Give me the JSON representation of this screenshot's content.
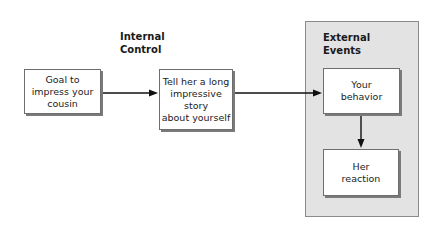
{
  "labels": {
    "internal_control": [
      "Internal",
      "Control"
    ],
    "external_events": [
      "External",
      "Events"
    ]
  },
  "nodes": {
    "goal": [
      "Goal to",
      "impress your",
      "cousin"
    ],
    "story": [
      "Tell her a long",
      "impressive",
      "story",
      "about yourself"
    ],
    "behavior": [
      "Your",
      "behavior"
    ],
    "reaction": [
      "Her",
      "reaction"
    ]
  },
  "edges": [
    {
      "from": "goal",
      "to": "story"
    },
    {
      "from": "story",
      "to": "behavior"
    },
    {
      "from": "behavior",
      "to": "reaction"
    }
  ],
  "colors": {
    "panel_bg": "#e3e3e3",
    "box_bg": "#ffffff",
    "arrow": "#111111"
  }
}
